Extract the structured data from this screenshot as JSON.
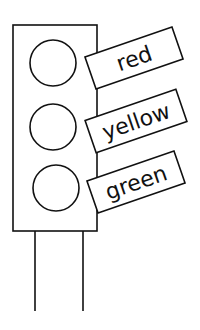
{
  "diagram": {
    "lights": [
      {
        "position": "top",
        "label": "red"
      },
      {
        "position": "middle",
        "label": "yellow"
      },
      {
        "position": "bottom",
        "label": "green"
      }
    ]
  },
  "colors": {
    "stroke": "#111111",
    "background": "#ffffff"
  }
}
